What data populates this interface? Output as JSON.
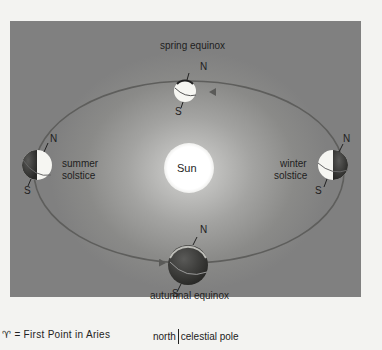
{
  "diagram": {
    "center_label": "Sun",
    "positions": {
      "spring": "spring equinox",
      "summer_line1": "summer",
      "summer_line2": "solstice",
      "winter_line1": "winter",
      "winter_line2": "solstice",
      "autumn": "autumnal equinox"
    },
    "pole_north": "N",
    "pole_south": "S"
  },
  "footer": {
    "aries_symbol": "♈︎",
    "aries_text": "= First Point in Aries",
    "pole_left": "north",
    "pole_right": "celestial pole"
  },
  "colors": {
    "background": "#f3f3f1",
    "panel": "#8a8a88",
    "orbit": "#5a5a58",
    "sun": "#ffffff",
    "globe_light": "#f4f4f0",
    "globe_dark": "#3a3a38"
  }
}
